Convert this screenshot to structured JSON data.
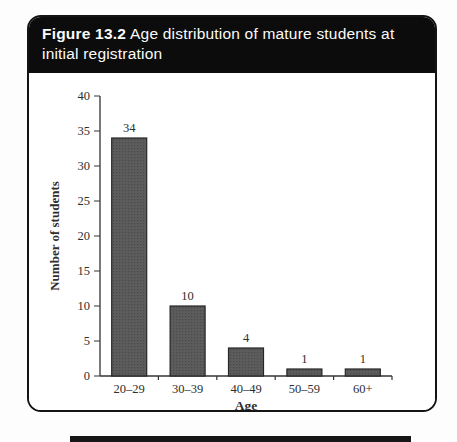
{
  "figure": {
    "label": "Figure 13.2",
    "title": "Age distribution of mature students at initial registration",
    "header_bg": "#0c0c0c",
    "header_text_color": "#fafafa"
  },
  "chart_data": {
    "type": "bar",
    "categories": [
      "20–29",
      "30–39",
      "40–49",
      "50–59",
      "60+"
    ],
    "values": [
      34,
      10,
      4,
      1,
      1
    ],
    "value_labels": [
      "34",
      "10",
      "4",
      "1",
      "1"
    ],
    "title": "",
    "xlabel": "Age",
    "ylabel": "Number of students",
    "ylim": [
      0,
      40
    ],
    "ytick_step": 5,
    "grid": false,
    "legend_position": "none",
    "bar_color": "#5c5c5c",
    "bar_dot_color": "#4a4a4a",
    "bar_border_color": "#262626",
    "axis_color": "#333333"
  },
  "page": {
    "bottom_rule_color": "#161616"
  }
}
